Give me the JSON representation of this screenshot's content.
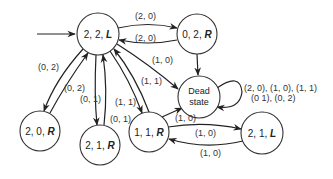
{
  "diagram": {
    "type": "state-transition",
    "nodes": {
      "n22L": {
        "prefix": "2, 2, ",
        "suffix": "L"
      },
      "n02R": {
        "prefix": "0, 2, ",
        "suffix": "R"
      },
      "dead": {
        "line1": "Dead",
        "line2": "state"
      },
      "n20R": {
        "prefix": "2, 0, ",
        "suffix": "R"
      },
      "n21R": {
        "prefix": "2, 1, ",
        "suffix": "R"
      },
      "n11R": {
        "prefix": "1, 1, ",
        "suffix": "R"
      },
      "n21L": {
        "prefix": "2, 1, ",
        "suffix": "L"
      }
    },
    "edges": {
      "e_22L_02R": "(2, 0)",
      "e_02R_22L": "(2, 0)",
      "e_22L_dead": "(1, 0)",
      "e_22L_11R": "(1, 1)",
      "e_11R_22L": "(1, 1)",
      "e_22L_20R": "(0, 2)",
      "e_20R_22L": "(0, 2)",
      "e_22L_21R": "(0, 1)",
      "e_21R_22L": "(0, 1)",
      "e_11R_dead": "(1, 0)",
      "e_11R_21L": "(1, 0)",
      "e_21L_11R": "(1, 0)",
      "e_dead_loop_line1": "(2, 0), (1, 0), (1, 1)",
      "e_dead_loop_line2": "(0  1), (0, 2)"
    }
  }
}
